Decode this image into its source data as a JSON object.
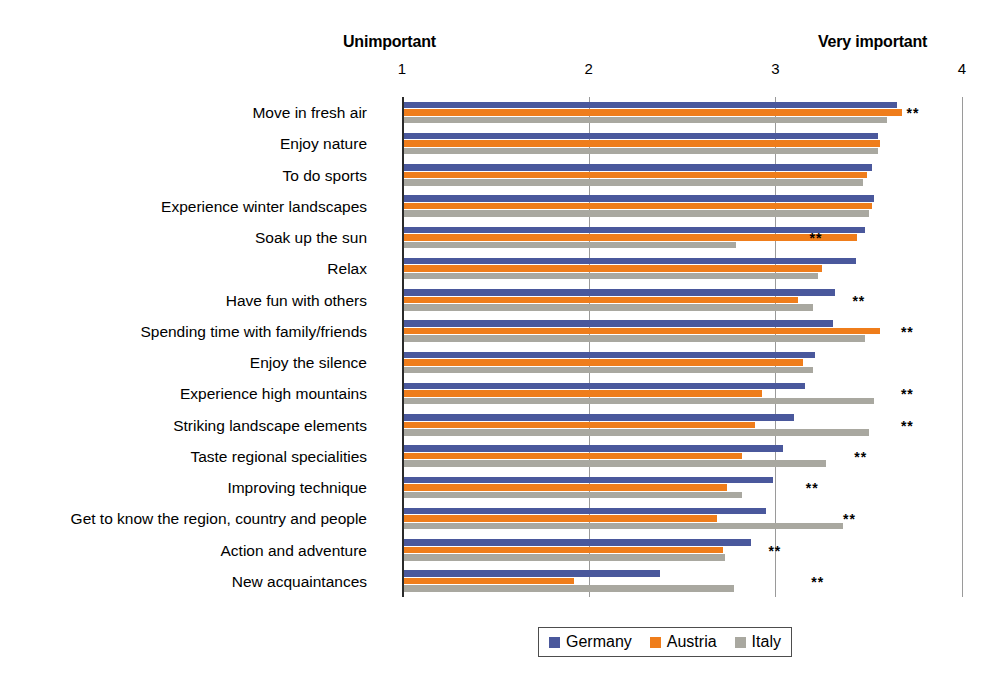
{
  "chart_data": {
    "type": "bar",
    "orientation": "horizontal",
    "title": "",
    "subtitle": "",
    "xlabel": "",
    "ylabel": "",
    "xlim": [
      1,
      4
    ],
    "xticks": [
      1,
      2,
      3,
      4
    ],
    "xtick_labels": [
      "1",
      "2",
      "3",
      "4"
    ],
    "grid": true,
    "grid_axis": "x",
    "legend_position": "bottom-center",
    "scale_anchor_low": "Unimportant",
    "scale_anchor_high": "Very important",
    "significance_marker": "**",
    "categories": [
      "Move in fresh air",
      "Enjoy nature",
      "To do sports",
      "Experience winter landscapes",
      "Soak up the sun",
      "Relax",
      "Have fun with others",
      "Spending time with family/friends",
      "Enjoy the silence",
      "Experience high mountains",
      "Striking landscape elements",
      "Taste regional specialities",
      "Improving technique",
      "Get to know the region, country and people",
      "Action and adventure",
      "New acquaintances"
    ],
    "series": [
      {
        "name": "Germany",
        "color": "#4a589c",
        "values": [
          3.65,
          3.55,
          3.52,
          3.53,
          3.48,
          3.43,
          3.32,
          3.31,
          3.21,
          3.16,
          3.1,
          3.04,
          2.99,
          2.95,
          2.87,
          2.38
        ]
      },
      {
        "name": "Austria",
        "color": "#ef7d1b",
        "values": [
          3.68,
          3.56,
          3.49,
          3.52,
          3.44,
          3.25,
          3.12,
          3.56,
          3.15,
          2.93,
          2.89,
          2.82,
          2.74,
          2.69,
          2.72,
          1.92
        ]
      },
      {
        "name": "Italy",
        "color": "#a9a8a0",
        "values": [
          3.6,
          3.55,
          3.47,
          3.5,
          2.79,
          3.23,
          3.2,
          3.48,
          3.2,
          3.53,
          3.5,
          3.27,
          2.82,
          3.36,
          2.73,
          2.78
        ]
      }
    ],
    "significance": [
      true,
      false,
      false,
      false,
      true,
      false,
      true,
      true,
      false,
      true,
      true,
      true,
      true,
      true,
      true,
      true
    ],
    "significance_x": [
      3.66,
      null,
      null,
      null,
      3.14,
      null,
      3.37,
      3.63,
      null,
      3.63,
      3.63,
      3.38,
      3.12,
      3.32,
      2.92,
      3.15
    ]
  },
  "legend": {
    "items": [
      {
        "label": "Germany",
        "color": "#4a589c"
      },
      {
        "label": "Austria",
        "color": "#ef7d1b"
      },
      {
        "label": "Italy",
        "color": "#a9a8a0"
      }
    ]
  },
  "colors": {
    "germany": "#4a589c",
    "austria": "#ef7d1b",
    "italy": "#a9a8a0",
    "axis": "#2b2b2b",
    "grid": "#9a9a9a",
    "background": "#ffffff",
    "text": "#000000"
  }
}
